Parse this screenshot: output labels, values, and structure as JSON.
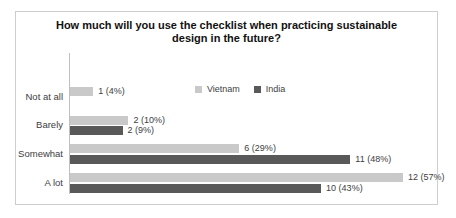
{
  "chart_data": {
    "type": "bar",
    "orientation": "horizontal",
    "title": "How much will you use the checklist when practicing sustainable design in the future?",
    "title_lines": [
      "How much will you use the checklist when practicing sustainable",
      "design in the future?"
    ],
    "categories": [
      "Not at all",
      "Barely",
      "Somewhat",
      "A lot"
    ],
    "series": [
      {
        "name": "Vietnam",
        "color": "#c9c9c9",
        "counts": [
          1,
          2,
          6,
          12
        ],
        "percents": [
          4,
          10,
          29,
          57
        ],
        "labels": [
          "1 (4%)",
          "2 (10%)",
          "6 (29%)",
          "12 (57%)"
        ]
      },
      {
        "name": "India",
        "color": "#595959",
        "counts": [
          0,
          2,
          11,
          10
        ],
        "percents": [
          0,
          9,
          48,
          43
        ],
        "labels": [
          null,
          "2 (9%)",
          "11 (48%)",
          "10 (43%)"
        ]
      }
    ],
    "value_axis": "percent",
    "xlim": [
      0,
      60
    ],
    "grid": false,
    "legend_position": "inside-top",
    "data_labels": true
  }
}
